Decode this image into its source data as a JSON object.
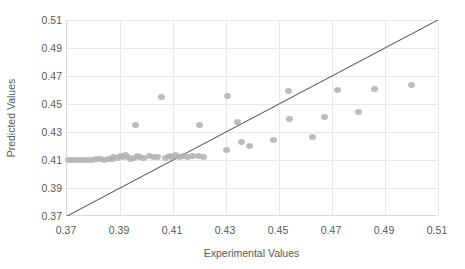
{
  "chart_data": {
    "type": "scatter",
    "title": "",
    "xlabel": "Experimental Values",
    "ylabel": "Predicted Values",
    "xlim": [
      0.37,
      0.51
    ],
    "ylim": [
      0.37,
      0.51
    ],
    "xticks": [
      "0.37",
      "0.39",
      "0.41",
      "0.43",
      "0.45",
      "0.47",
      "0.49",
      "0.51"
    ],
    "yticks": [
      "0.37",
      "0.39",
      "0.41",
      "0.43",
      "0.45",
      "0.47",
      "0.49",
      "0.51"
    ],
    "grid": true,
    "legend": "none",
    "marker_color": "#b3b3b3",
    "line_color": "#595959",
    "reference_line": {
      "name": "parity-line",
      "from": [
        0.37,
        0.37
      ],
      "to": [
        0.51,
        0.51
      ]
    },
    "series": [
      {
        "name": "Predicted vs Experimental",
        "points": [
          [
            0.3705,
            0.41
          ],
          [
            0.372,
            0.4099
          ],
          [
            0.3735,
            0.4101
          ],
          [
            0.375,
            0.41
          ],
          [
            0.3765,
            0.4102
          ],
          [
            0.378,
            0.4103
          ],
          [
            0.3795,
            0.4098
          ],
          [
            0.381,
            0.4104
          ],
          [
            0.3825,
            0.4106
          ],
          [
            0.384,
            0.4102
          ],
          [
            0.3855,
            0.4109
          ],
          [
            0.387,
            0.411
          ],
          [
            0.3875,
            0.4124
          ],
          [
            0.389,
            0.4112
          ],
          [
            0.39,
            0.4128
          ],
          [
            0.391,
            0.4118
          ],
          [
            0.392,
            0.4133
          ],
          [
            0.393,
            0.412
          ],
          [
            0.394,
            0.4106
          ],
          [
            0.395,
            0.4115
          ],
          [
            0.3958,
            0.435
          ],
          [
            0.3965,
            0.4131
          ],
          [
            0.3975,
            0.4122
          ],
          [
            0.399,
            0.4116
          ],
          [
            0.401,
            0.4129
          ],
          [
            0.4025,
            0.4119
          ],
          [
            0.404,
            0.4125
          ],
          [
            0.4055,
            0.455
          ],
          [
            0.407,
            0.4117
          ],
          [
            0.4085,
            0.4128
          ],
          [
            0.4095,
            0.412
          ],
          [
            0.411,
            0.4133
          ],
          [
            0.4125,
            0.4122
          ],
          [
            0.414,
            0.4127
          ],
          [
            0.4155,
            0.4118
          ],
          [
            0.4175,
            0.4131
          ],
          [
            0.4195,
            0.4126
          ],
          [
            0.42,
            0.435
          ],
          [
            0.4215,
            0.412
          ],
          [
            0.43,
            0.4175
          ],
          [
            0.4305,
            0.4555
          ],
          [
            0.4345,
            0.4375
          ],
          [
            0.436,
            0.4232
          ],
          [
            0.439,
            0.42
          ],
          [
            0.448,
            0.424
          ],
          [
            0.4535,
            0.459
          ],
          [
            0.454,
            0.439
          ],
          [
            0.4625,
            0.4262
          ],
          [
            0.467,
            0.4405
          ],
          [
            0.472,
            0.46
          ],
          [
            0.48,
            0.444
          ],
          [
            0.486,
            0.4605
          ],
          [
            0.5,
            0.4635
          ]
        ]
      }
    ]
  }
}
